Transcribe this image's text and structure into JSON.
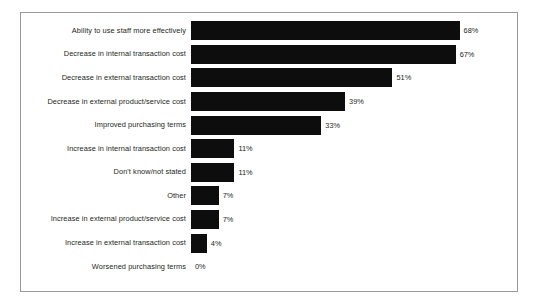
{
  "chart_data": {
    "type": "bar",
    "orientation": "horizontal",
    "title": "",
    "subtitle": "",
    "xlabel": "",
    "ylabel": "",
    "xlim": [
      0,
      70
    ],
    "grid": false,
    "legend": null,
    "value_suffix": "%",
    "bar_color": "#0d0d0d",
    "text_color": "#231f20",
    "frame_color": "#9a9a9a",
    "categories": [
      "Ability to use staff more effectively",
      "Decrease in internal transaction cost",
      "Decrease in external transaction cost",
      "Decrease in external product/service cost",
      "Improved purchasing terms",
      "Increase in internal transaction cost",
      "Don't know/not stated",
      "Other",
      "Increase in external product/service cost",
      "Increase in external transaction cost",
      "Worsened purchasing terms"
    ],
    "values": [
      68,
      67,
      51,
      39,
      33,
      11,
      11,
      7,
      7,
      4,
      0
    ],
    "value_labels": [
      "68%",
      "67%",
      "51%",
      "39%",
      "33%",
      "11%",
      "11%",
      "7%",
      "7%",
      "4%",
      "0%"
    ]
  },
  "rows": [
    {
      "label": "Ability to use staff more effectively",
      "value": 68,
      "value_label": "68%"
    },
    {
      "label": "Decrease in internal transaction cost",
      "value": 67,
      "value_label": "67%"
    },
    {
      "label": "Decrease in external transaction cost",
      "value": 51,
      "value_label": "51%"
    },
    {
      "label": "Decrease in external product/service cost",
      "value": 39,
      "value_label": "39%"
    },
    {
      "label": "Improved purchasing terms",
      "value": 33,
      "value_label": "33%"
    },
    {
      "label": "Increase in internal transaction cost",
      "value": 11,
      "value_label": "11%"
    },
    {
      "label": "Don't know/not stated",
      "value": 11,
      "value_label": "11%"
    },
    {
      "label": "Other",
      "value": 7,
      "value_label": "7%"
    },
    {
      "label": "Increase in external product/service cost",
      "value": 7,
      "value_label": "7%"
    },
    {
      "label": "Increase in external transaction cost",
      "value": 4,
      "value_label": "4%"
    },
    {
      "label": "Worsened purchasing terms",
      "value": 0,
      "value_label": "0%"
    }
  ]
}
